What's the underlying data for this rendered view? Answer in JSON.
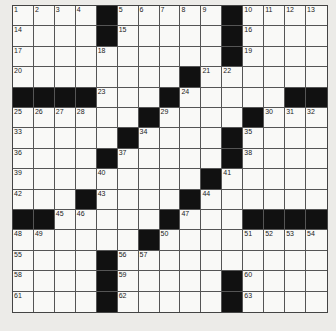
{
  "puzzle": {
    "type": "crossword",
    "rows": 15,
    "cols": 15,
    "layout": [
      "1234#56789#ABCD",
      "E...#F....#G...",
      "H...I.....#J...",
      "K.......#LM....",
      "####N..#O....##",
      "PQRS..#T...#UVW",
      "X....#Y....Z...",
      "a...#b....#c...",
      "d...e....#f....",
      "g..#h...#i.....",
      "##jk...#l..####",
      "mn....#o...pqrs",
      "t...#uv........",
      "w...#x....#y...",
      "z...#{....#}..."
    ],
    "numbers": [
      {
        "r": 0,
        "c": 0,
        "n": "1"
      },
      {
        "r": 0,
        "c": 1,
        "n": "2"
      },
      {
        "r": 0,
        "c": 2,
        "n": "3"
      },
      {
        "r": 0,
        "c": 3,
        "n": "4"
      },
      {
        "r": 0,
        "c": 5,
        "n": "5"
      },
      {
        "r": 0,
        "c": 6,
        "n": "6"
      },
      {
        "r": 0,
        "c": 7,
        "n": "7"
      },
      {
        "r": 0,
        "c": 8,
        "n": "8"
      },
      {
        "r": 0,
        "c": 9,
        "n": "9"
      },
      {
        "r": 0,
        "c": 11,
        "n": "10"
      },
      {
        "r": 0,
        "c": 12,
        "n": "11"
      },
      {
        "r": 0,
        "c": 13,
        "n": "12"
      },
      {
        "r": 0,
        "c": 14,
        "n": "13"
      },
      {
        "r": 1,
        "c": 0,
        "n": "14"
      },
      {
        "r": 1,
        "c": 5,
        "n": "15"
      },
      {
        "r": 1,
        "c": 11,
        "n": "16"
      },
      {
        "r": 2,
        "c": 0,
        "n": "17"
      },
      {
        "r": 2,
        "c": 4,
        "n": "18"
      },
      {
        "r": 2,
        "c": 11,
        "n": "19"
      },
      {
        "r": 3,
        "c": 0,
        "n": "20"
      },
      {
        "r": 3,
        "c": 9,
        "n": "21"
      },
      {
        "r": 3,
        "c": 10,
        "n": "22"
      },
      {
        "r": 4,
        "c": 4,
        "n": "23"
      },
      {
        "r": 4,
        "c": 8,
        "n": "24"
      },
      {
        "r": 5,
        "c": 0,
        "n": "25"
      },
      {
        "r": 5,
        "c": 1,
        "n": "26"
      },
      {
        "r": 5,
        "c": 2,
        "n": "27"
      },
      {
        "r": 5,
        "c": 3,
        "n": "28"
      },
      {
        "r": 5,
        "c": 7,
        "n": "29"
      },
      {
        "r": 5,
        "c": 12,
        "n": "30"
      },
      {
        "r": 5,
        "c": 13,
        "n": "31"
      },
      {
        "r": 5,
        "c": 14,
        "n": "32"
      },
      {
        "r": 6,
        "c": 0,
        "n": "33"
      },
      {
        "r": 6,
        "c": 6,
        "n": "34"
      },
      {
        "r": 6,
        "c": 11,
        "n": "35"
      },
      {
        "r": 7,
        "c": 0,
        "n": "36"
      },
      {
        "r": 7,
        "c": 5,
        "n": "37"
      },
      {
        "r": 7,
        "c": 11,
        "n": "38"
      },
      {
        "r": 8,
        "c": 0,
        "n": "39"
      },
      {
        "r": 8,
        "c": 4,
        "n": "40"
      },
      {
        "r": 8,
        "c": 10,
        "n": "41"
      },
      {
        "r": 9,
        "c": 0,
        "n": "42"
      },
      {
        "r": 9,
        "c": 4,
        "n": "43"
      },
      {
        "r": 9,
        "c": 9,
        "n": "44"
      },
      {
        "r": 10,
        "c": 2,
        "n": "45"
      },
      {
        "r": 10,
        "c": 3,
        "n": "46"
      },
      {
        "r": 10,
        "c": 8,
        "n": "47"
      },
      {
        "r": 11,
        "c": 0,
        "n": "48"
      },
      {
        "r": 11,
        "c": 1,
        "n": "49"
      },
      {
        "r": 11,
        "c": 7,
        "n": "50"
      },
      {
        "r": 11,
        "c": 11,
        "n": "51"
      },
      {
        "r": 11,
        "c": 12,
        "n": "52"
      },
      {
        "r": 11,
        "c": 13,
        "n": "53"
      },
      {
        "r": 11,
        "c": 14,
        "n": "54"
      },
      {
        "r": 12,
        "c": 0,
        "n": "55"
      },
      {
        "r": 12,
        "c": 5,
        "n": "56"
      },
      {
        "r": 12,
        "c": 6,
        "n": "57"
      },
      {
        "r": 13,
        "c": 0,
        "n": "58"
      },
      {
        "r": 13,
        "c": 5,
        "n": "59"
      },
      {
        "r": 13,
        "c": 11,
        "n": "60"
      },
      {
        "r": 14,
        "c": 0,
        "n": "61"
      },
      {
        "r": 14,
        "c": 5,
        "n": "62"
      },
      {
        "r": 14,
        "c": 11,
        "n": "63"
      }
    ],
    "black_cells": [
      [
        0,
        4
      ],
      [
        0,
        10
      ],
      [
        1,
        4
      ],
      [
        1,
        10
      ],
      [
        2,
        10
      ],
      [
        3,
        8
      ],
      [
        4,
        0
      ],
      [
        4,
        1
      ],
      [
        4,
        2
      ],
      [
        4,
        3
      ],
      [
        4,
        7
      ],
      [
        4,
        13
      ],
      [
        4,
        14
      ],
      [
        5,
        6
      ],
      [
        5,
        11
      ],
      [
        6,
        5
      ],
      [
        6,
        10
      ],
      [
        7,
        4
      ],
      [
        7,
        10
      ],
      [
        8,
        9
      ],
      [
        9,
        3
      ],
      [
        9,
        8
      ],
      [
        10,
        0
      ],
      [
        10,
        1
      ],
      [
        10,
        7
      ],
      [
        10,
        11
      ],
      [
        10,
        12
      ],
      [
        10,
        13
      ],
      [
        10,
        14
      ],
      [
        11,
        6
      ],
      [
        12,
        4
      ],
      [
        13,
        4
      ],
      [
        13,
        10
      ],
      [
        14,
        4
      ],
      [
        14,
        10
      ]
    ],
    "colors": {
      "page": "#ecebe8",
      "cell": "#f9f9f7",
      "block": "#111111",
      "line": "#555555"
    }
  }
}
